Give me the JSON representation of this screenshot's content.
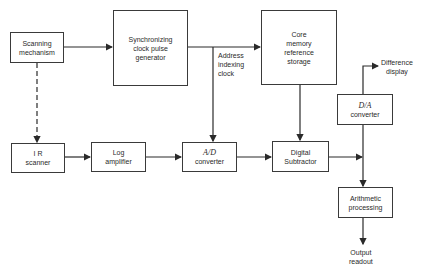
{
  "blocks": {
    "scanning_mechanism": {
      "label": "Scanning\nmechanism"
    },
    "sync_clock": {
      "label": "Synchronizing\nclock  pulse\ngenerator"
    },
    "core_memory": {
      "label": "Core\nmemory\nreference\nstorage"
    },
    "da_converter": {
      "label1": "D/A",
      "label2": "converter"
    },
    "ir_scanner": {
      "label": "I R\nscanner"
    },
    "log_amplifier": {
      "label": "Log\namplifier"
    },
    "ad_converter": {
      "label1": "A/D",
      "label2": "converter"
    },
    "digital_subtractor": {
      "label": "Digital\nSubtractor"
    },
    "arithmetic_processing": {
      "label": "Arithmetic\nprocessing"
    }
  },
  "labels": {
    "address_clock": "Address\nindexing\nclock",
    "difference_display": "Difference\ndisplay",
    "output_readout": "Output\nreadout"
  }
}
